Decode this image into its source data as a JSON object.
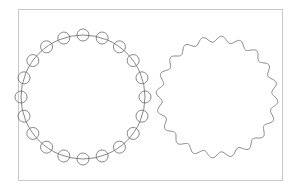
{
  "figure": {
    "frame": {
      "x": 18,
      "y": 9,
      "width": 264,
      "height": 171,
      "stroke": "#c8c8c8"
    },
    "left_shape": {
      "name": "circle-with-beads",
      "center": [
        83,
        97
      ],
      "radius": 62,
      "bead_count": 20,
      "bead_radius": 6,
      "stroke": "#6a6a6a"
    },
    "right_shape": {
      "name": "wavy-circle",
      "center": [
        217,
        97
      ],
      "radius": 58,
      "wave_count": 20,
      "wave_amplitude": 3,
      "stroke": "#7a7a7a"
    }
  }
}
